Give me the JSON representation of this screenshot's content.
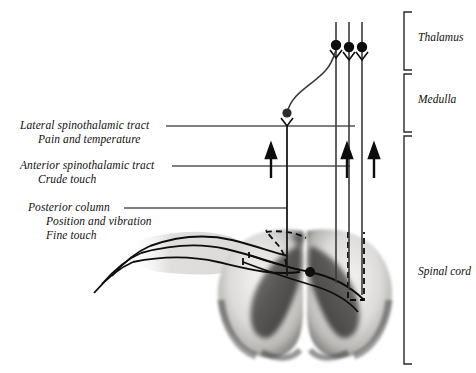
{
  "figure": {
    "background": "#ffffff",
    "ink": "#101010",
    "leader_color": "#555555"
  },
  "left_labels": [
    {
      "id": "lateral-spinothalamic",
      "line1": "Lateral spinothalamic tract",
      "line2": "Pain and temperature",
      "x": 20,
      "y": 120,
      "leader": {
        "x1": 166,
        "y1": 126,
        "x2": 355,
        "y2": 126
      }
    },
    {
      "id": "anterior-spinothalamic",
      "line1": "Anterior spinothalamic tract",
      "line2": "Crude touch",
      "x": 20,
      "y": 160,
      "leader": {
        "x1": 172,
        "y1": 166,
        "x2": 350,
        "y2": 166
      }
    },
    {
      "id": "posterior-column",
      "line1": "Posterior column",
      "line2": "Position and vibration",
      "line3": "Fine touch",
      "x": 28,
      "y": 202,
      "leader": {
        "x1": 124,
        "y1": 208,
        "x2": 287,
        "y2": 208
      }
    }
  ],
  "region_labels": [
    {
      "id": "thalamus",
      "text": "Thalamus",
      "x": 418,
      "y": 38,
      "bracket": {
        "x": 404,
        "y1": 12,
        "y2": 70,
        "tick": 8
      }
    },
    {
      "id": "medulla",
      "text": "Medulla",
      "x": 418,
      "y": 100,
      "bracket": {
        "x": 404,
        "y1": 74,
        "y2": 132,
        "tick": 8
      }
    },
    {
      "id": "spinal-cord",
      "text": "Spinal cord",
      "x": 418,
      "y": 272,
      "bracket": {
        "x": 404,
        "y1": 136,
        "y2": 364,
        "tick": 8
      }
    }
  ],
  "tracts": {
    "vertical_lines": [
      {
        "id": "decussating-fiber",
        "x": 287,
        "top": 128,
        "bottom": 275
      },
      {
        "id": "lateral-tract-line",
        "x": 336,
        "top": 22,
        "bottom": 283
      },
      {
        "id": "anterior-tract-line",
        "x": 349,
        "top": 22,
        "bottom": 290
      },
      {
        "id": "posterior-column-line",
        "x": 362,
        "top": 22,
        "bottom": 295
      }
    ],
    "thalamic_synapses": [
      {
        "id": "synapse-1",
        "cx": 336,
        "cy": 45,
        "r": 5
      },
      {
        "id": "synapse-2",
        "cx": 349,
        "cy": 47,
        "r": 5
      },
      {
        "id": "synapse-3",
        "cx": 362,
        "cy": 47,
        "r": 5
      }
    ],
    "medulla_synapse": {
      "id": "nucleus-gracilis-cuneatus",
      "cx": 287,
      "cy": 113,
      "r": 4.5
    },
    "direction_arrows": [
      {
        "id": "arrow-left",
        "x": 271,
        "y_tail": 177,
        "y_head": 148
      },
      {
        "id": "arrow-middle",
        "x": 347,
        "y_tail": 177,
        "y_head": 148
      },
      {
        "id": "arrow-right",
        "x": 374,
        "y_tail": 177,
        "y_head": 148
      }
    ]
  },
  "cord": {
    "center_synapse": {
      "id": "dorsal-horn-synapse",
      "cx": 310,
      "cy": 272,
      "r": 5
    },
    "root_ganglia": [
      {
        "id": "ganglion-1",
        "cx": 150,
        "cy": 246,
        "r": 4.5
      },
      {
        "id": "ganglion-2",
        "cx": 141,
        "cy": 253,
        "r": 4.5
      },
      {
        "id": "ganglion-3",
        "cx": 133,
        "cy": 262,
        "r": 4.5
      }
    ]
  }
}
